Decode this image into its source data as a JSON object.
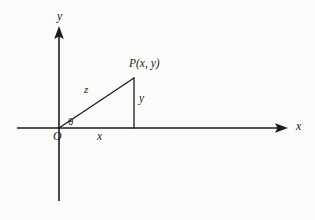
{
  "figure": {
    "kind": "right-triangle-polar-coordinates-diagram",
    "background_color": "#fbfbf9",
    "ink_color": "#1b1b1b"
  },
  "axes": {
    "x_label": "x",
    "y_label": "y",
    "origin_label": "O",
    "x_axis": {
      "start_x": 17,
      "end_x": 288,
      "y": 128,
      "arrow": "right"
    },
    "y_axis": {
      "x": 59,
      "top_y": 26,
      "bottom_y": 201,
      "arrow": "up"
    }
  },
  "triangle": {
    "origin": {
      "x": 59,
      "y": 128
    },
    "point_p": {
      "x": 134,
      "y": 78
    },
    "foot": {
      "x": 134,
      "y": 128
    },
    "hypotenuse_label": "z",
    "opposite_label": "y",
    "adjacent_label": "x",
    "angle_label": "θ",
    "vertex_label": "P(x, y)"
  }
}
